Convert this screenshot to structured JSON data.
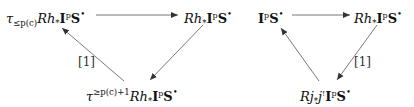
{
  "diagrams": [
    {
      "name": "left-triangle",
      "nodes": {
        "top_left": {
          "tau": "τ",
          "sub": "≤p(c)",
          "R": "R",
          "h": "h",
          "star": "*",
          "I": "I",
          "p": "p",
          "S": "S",
          "bullet": "•"
        },
        "top_right": {
          "R": "R",
          "h": "h",
          "star": "*",
          "I": "I",
          "p": "p",
          "S": "S",
          "bullet": "•"
        },
        "bottom": {
          "tau": "τ",
          "sup": "≥p(c)+1",
          "R": "R",
          "h": "h",
          "star": "*",
          "I": "I",
          "p": "p",
          "S": "S",
          "bullet": "•"
        }
      },
      "arrows": [
        {
          "from": "top_left",
          "to": "top_right",
          "label": ""
        },
        {
          "from": "top_right",
          "to": "bottom",
          "label": ""
        },
        {
          "from": "bottom",
          "to": "top_left",
          "label": "[1]"
        }
      ],
      "shift_label": "[1]"
    },
    {
      "name": "right-triangle",
      "nodes": {
        "top_left": {
          "I": "I",
          "p": "p",
          "S": "S",
          "bullet": "•"
        },
        "top_right": {
          "R": "R",
          "h": "h",
          "star": "*",
          "I": "I",
          "p": "p",
          "S": "S",
          "bullet": "•"
        },
        "bottom": {
          "R": "R",
          "j": "j",
          "star": "*",
          "j2": "j",
          "shriek": "!",
          "I": "I",
          "p": "p",
          "S": "S",
          "bullet": "•"
        }
      },
      "arrows": [
        {
          "from": "top_left",
          "to": "top_right",
          "label": ""
        },
        {
          "from": "top_right",
          "to": "bottom",
          "label": "[1]"
        },
        {
          "from": "bottom",
          "to": "top_left",
          "label": ""
        }
      ],
      "shift_label": "[1]"
    }
  ],
  "colors": {
    "text": "#111111",
    "arrow": "#333333"
  }
}
